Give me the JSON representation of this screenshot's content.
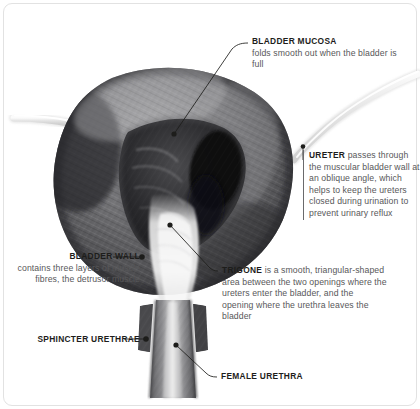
{
  "figure": {
    "frame_color": "#e2e2e2",
    "background": "#ffffff",
    "heading_color": "#1d1d1b",
    "body_color": "#58585a",
    "leader_color": "#1d1d1b"
  },
  "labels": {
    "bladder_mucosa": {
      "heading": "BLADDER MUCOSA",
      "body": "folds smooth out when the bladder is full"
    },
    "ureter": {
      "heading": "URETER",
      "body": " passes through the muscular bladder wall at an oblique angle, which helps to keep the ureters closed during urination to prevent urinary reflux"
    },
    "trigone": {
      "heading": "TRIGONE",
      "body": " is a smooth, triangular-shaped area between the two openings where the ureters enter the bladder, and the opening where the urethra leaves the bladder"
    },
    "bladder_wall": {
      "heading": "BLADDER WALL",
      "body": "contains three layers of muscle fibres, the detrusor muscle"
    },
    "sphincter_urethrae": {
      "heading": "SPHINCTER URETHRAE",
      "body": ""
    },
    "female_urethra": {
      "heading": "FEMALE URETHRA",
      "body": ""
    }
  },
  "anatomy": {
    "parts": [
      "bladder-dome",
      "bladder-cavity",
      "bladder-mucosa-folds",
      "left-ureter-tube",
      "right-ureter-tube",
      "trigone",
      "urethra",
      "sphincter-urethrae-band"
    ],
    "palette": {
      "muscle_dark": "#3a3a3c",
      "muscle_mid": "#6e6e70",
      "muscle_light": "#b9b9bb",
      "cavity_shadow": "#1a1a1c",
      "highlight": "#f2f2f2",
      "tube_pale": "#e9e9e9"
    }
  }
}
